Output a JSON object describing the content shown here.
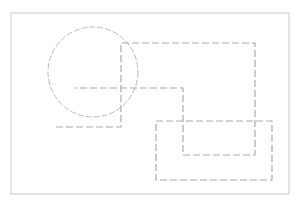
{
  "canvas": {
    "width": 298,
    "height": 201,
    "background": "#ffffff"
  },
  "frame": {
    "x": 11,
    "y": 13,
    "width": 278,
    "height": 181,
    "stroke": "#d9d9d9",
    "stroke_width": 1.5
  },
  "shapes": {
    "circle": {
      "cx": 93,
      "cy": 72,
      "r": 45,
      "stroke": "#b8b8b8",
      "dash": "6 2"
    },
    "path_top": {
      "points": "56,127 121,127 121,43 255,43 255,155 183,155 183,88 74,88",
      "stroke": "#a8a8a8",
      "dash": "7 3"
    },
    "rect_lower": {
      "x": 156,
      "y": 121,
      "width": 116,
      "height": 59,
      "stroke": "#a8a8a8",
      "dash": "7 3"
    }
  }
}
